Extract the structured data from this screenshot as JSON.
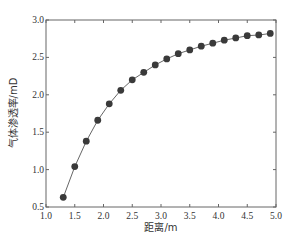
{
  "chart_data": {
    "type": "line",
    "title": "",
    "xlabel": "距离/m",
    "ylabel": "气体渗透率/mD",
    "xlim": [
      1.0,
      5.0
    ],
    "ylim": [
      0.5,
      3.0
    ],
    "x_ticks": [
      "1.0",
      "1.5",
      "2.0",
      "2.5",
      "3.0",
      "3.5",
      "4.0",
      "4.5",
      "5.0"
    ],
    "y_ticks": [
      "0.5",
      "1.0",
      "1.5",
      "2.0",
      "2.5",
      "3.0"
    ],
    "grid": false,
    "legend": null,
    "marker": "circle",
    "series": [
      {
        "name": "气体渗透率",
        "x": [
          1.3,
          1.5,
          1.7,
          1.9,
          2.1,
          2.3,
          2.5,
          2.7,
          2.9,
          3.1,
          3.3,
          3.5,
          3.7,
          3.9,
          4.1,
          4.3,
          4.5,
          4.7,
          4.9
        ],
        "y": [
          0.63,
          1.04,
          1.38,
          1.66,
          1.88,
          2.06,
          2.2,
          2.3,
          2.4,
          2.48,
          2.55,
          2.6,
          2.65,
          2.69,
          2.73,
          2.76,
          2.79,
          2.8,
          2.82
        ]
      }
    ]
  },
  "colors": {
    "line": "#555555",
    "marker": "#3a3a3a",
    "axis": "#666666"
  }
}
